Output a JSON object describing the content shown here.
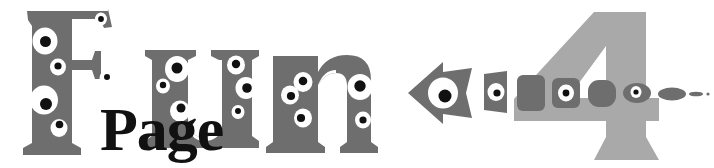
{
  "banner": {
    "title_text": "Fun Page 4",
    "headline_word": "Fun",
    "subhead_word": "Page",
    "issue_number": "4",
    "alt_text": "Fun Page 4",
    "background_color": "#ffffff"
  },
  "colors": {
    "letter_gray": "#6e6e6e",
    "numeral_gray": "#a9a9a9",
    "subhead_black": "#111111",
    "eye_white": "#ffffff",
    "pupil_black": "#111111",
    "background": "#ffffff"
  },
  "letters": [
    {
      "glyph": "F",
      "name": "letter-f",
      "color": "#6e6e6e",
      "eye_count": 5
    },
    {
      "glyph": "u",
      "name": "letter-u",
      "color": "#6e6e6e",
      "eye_count": 5
    },
    {
      "glyph": "n",
      "name": "letter-n",
      "color": "#6e6e6e",
      "eye_count": 4
    }
  ],
  "subhead": {
    "text": "Page",
    "color": "#111111"
  },
  "numeral": {
    "text": "4",
    "color": "#a9a9a9"
  },
  "arrow_trail": {
    "direction": "left",
    "shape_count": 8,
    "color": "#6e6e6e",
    "shapes": [
      {
        "name": "arrow-head",
        "has_eye": true
      },
      {
        "name": "trail-shape-1",
        "has_eye": true
      },
      {
        "name": "trail-shape-2",
        "has_eye": false
      },
      {
        "name": "trail-shape-3",
        "has_eye": true
      },
      {
        "name": "trail-shape-4",
        "has_eye": false
      },
      {
        "name": "trail-shape-5",
        "has_eye": true
      },
      {
        "name": "trail-shape-6",
        "has_eye": false
      },
      {
        "name": "trail-shape-7",
        "has_eye": false
      }
    ]
  }
}
